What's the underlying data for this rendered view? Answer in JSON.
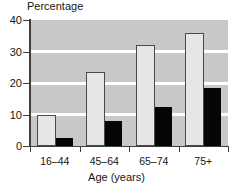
{
  "chart_data": {
    "type": "bar",
    "title": "Percentage",
    "xlabel": "Age (years)",
    "ylabel": "",
    "categories": [
      "16–44",
      "45–64",
      "65–74",
      "75+"
    ],
    "series": [
      {
        "name": "series-light",
        "color": "#e6e6e6",
        "values": [
          10,
          23.5,
          32,
          36
        ]
      },
      {
        "name": "series-dark",
        "color": "#050505",
        "values": [
          2.5,
          8,
          12.5,
          18.5
        ]
      }
    ],
    "ylim": [
      0,
      40
    ],
    "yticks": [
      0,
      10,
      20,
      30,
      40
    ],
    "ytick_labels": [
      "0",
      "10",
      "20",
      "30",
      "40"
    ],
    "grid": true,
    "grid_orientation": "horizontal",
    "legend": "none",
    "plot_background": "#c8c8c8",
    "gridline_color": "#ffffff",
    "axis_color": "#3d3d3d"
  }
}
